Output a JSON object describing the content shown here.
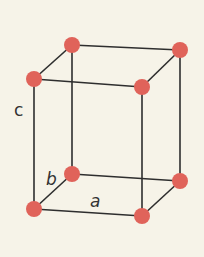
{
  "diagram": {
    "type": "unit-cell",
    "background_color": "#f6f3e8",
    "atom_color": "#e0635a",
    "edge_color": "#2e2e2e",
    "labels": {
      "a": "a",
      "b": "b",
      "c": "c"
    },
    "atoms": [
      {
        "id": "top-back-left",
        "x": 72,
        "y": 45
      },
      {
        "id": "top-back-right",
        "x": 180,
        "y": 50
      },
      {
        "id": "top-front-left",
        "x": 34,
        "y": 79
      },
      {
        "id": "top-front-right",
        "x": 142,
        "y": 87
      },
      {
        "id": "bottom-back-left",
        "x": 72,
        "y": 174
      },
      {
        "id": "bottom-back-right",
        "x": 180,
        "y": 181
      },
      {
        "id": "bottom-front-left",
        "x": 34,
        "y": 209
      },
      {
        "id": "bottom-front-right",
        "x": 142,
        "y": 216
      }
    ]
  }
}
